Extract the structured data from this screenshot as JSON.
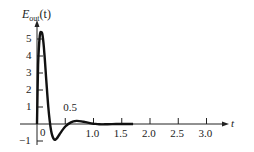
{
  "chart_data": {
    "type": "line",
    "title": "",
    "ylabel": "E_out(t)",
    "ylabel_main": "E",
    "ylabel_sub": "out",
    "ylabel_arg": "(t)",
    "xlabel": "t",
    "xlim": [
      0,
      3.4
    ],
    "ylim": [
      -1,
      5.6
    ],
    "grid": false,
    "x_ticks": [
      0.5,
      1.0,
      1.5,
      2.0,
      2.5,
      3.0
    ],
    "x_tick_labels": [
      "0.5",
      "1.0",
      "1.5",
      "2.0",
      "2.5",
      "3.0"
    ],
    "y_ticks": [
      -1,
      1,
      2,
      3,
      4,
      5
    ],
    "y_tick_labels": [
      "−1",
      "1",
      "2",
      "3",
      "4",
      "5"
    ],
    "origin_label": "0",
    "series": [
      {
        "name": "E_out(t)",
        "x": [
          0,
          0.02,
          0.05,
          0.08,
          0.1,
          0.13,
          0.16,
          0.2,
          0.25,
          0.3,
          0.35,
          0.4,
          0.5,
          0.6,
          0.7,
          0.8,
          0.9,
          1.0,
          1.1,
          1.2,
          1.4,
          1.6,
          1.7
        ],
        "values": [
          0,
          3.5,
          5.2,
          5.4,
          5.2,
          4.2,
          2.8,
          1.0,
          -0.4,
          -0.9,
          -0.85,
          -0.6,
          -0.15,
          0.1,
          0.18,
          0.15,
          0.08,
          0.02,
          -0.02,
          -0.02,
          0.0,
          0.0,
          0.0
        ]
      }
    ]
  }
}
